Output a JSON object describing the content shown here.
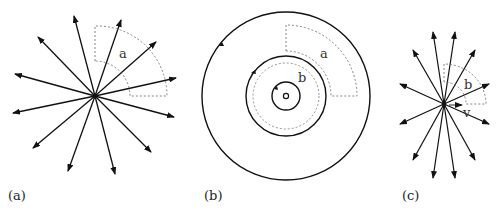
{
  "figure": {
    "panels": [
      {
        "id": "a",
        "label": "(a)",
        "center": [
          95,
          96
        ],
        "description": "Radial arrows emanating outward from a point source",
        "arrow_count": 12,
        "sector": {
          "label": "a",
          "inner_radius": 35,
          "outer_radius": 72,
          "start_angle_deg": 0,
          "end_angle_deg": 90
        }
      },
      {
        "id": "b",
        "label": "(b)",
        "center": [
          286,
          96
        ],
        "description": "Concentric circular field lines with counter-clockwise arrows",
        "circles": [
          {
            "radius": 2.5,
            "style": "solid"
          },
          {
            "radius": 14,
            "style": "solid",
            "arrow": true
          },
          {
            "radius": 33,
            "style": "dotted"
          },
          {
            "radius": 40,
            "style": "solid",
            "arrow": true
          },
          {
            "radius": 84,
            "style": "solid",
            "arrow": true
          }
        ],
        "sector_a": {
          "label": "a",
          "inner_radius": 45,
          "outer_radius": 75,
          "start_angle_deg": 0,
          "end_angle_deg": 90
        },
        "region_b": {
          "label": "b"
        }
      },
      {
        "id": "c",
        "label": "(c)",
        "center": [
          444,
          104
        ],
        "description": "Radial arrows from a moving source, compressed vertically",
        "arrow_count": 12,
        "sector": {
          "label": "b",
          "inner_radius": 22,
          "outer_radius": 42,
          "start_angle_deg": 0,
          "end_angle_deg": 90
        },
        "velocity": {
          "label": "v"
        }
      }
    ]
  }
}
